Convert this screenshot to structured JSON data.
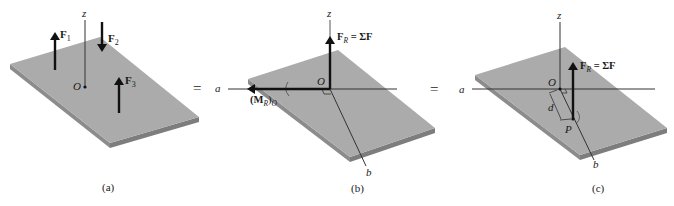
{
  "colors": {
    "plate_top": "#a9a9a9",
    "plate_side": "#8c8c8c",
    "plate_edge": "#7a7a7a",
    "arrow": "#111111",
    "axis": "#333333",
    "background": "#ffffff"
  },
  "panels": [
    {
      "id": "a",
      "caption": "(a)",
      "axis_z": "z",
      "origin": "O",
      "forces": [
        {
          "label": "F",
          "sub": "1",
          "direction": "up"
        },
        {
          "label": "F",
          "sub": "2",
          "direction": "down"
        },
        {
          "label": "F",
          "sub": "3",
          "direction": "up"
        }
      ]
    },
    {
      "id": "b",
      "caption": "(b)",
      "axis_z": "z",
      "axis_a": "a",
      "axis_b": "b",
      "origin": "O",
      "resultant_force": {
        "label": "F",
        "sub": "R",
        "eq": " = ΣF"
      },
      "resultant_moment": {
        "label": "(M",
        "sub": "R",
        "close": ")",
        "sub2": "O"
      }
    },
    {
      "id": "c",
      "caption": "(c)",
      "axis_z": "z",
      "axis_a": "a",
      "axis_b": "b",
      "origin": "O",
      "point": "P",
      "distance": "d",
      "resultant_force": {
        "label": "F",
        "sub": "R",
        "eq": " = ΣF"
      }
    }
  ],
  "equals": [
    "=",
    "="
  ]
}
